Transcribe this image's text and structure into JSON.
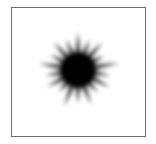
{
  "figure": {
    "shape": "starburst-icon",
    "colors": {
      "fill": "#000000",
      "background": "#ffffff",
      "border": "#6e6e6e"
    }
  }
}
